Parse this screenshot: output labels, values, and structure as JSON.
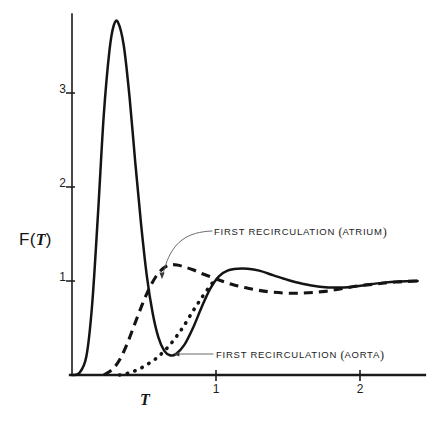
{
  "figure": {
    "axis_labels": {
      "y": "F(T)",
      "y_function": "F",
      "y_variable": "T",
      "x": "T"
    },
    "y_ticks": [
      "1",
      "2",
      "3"
    ],
    "x_ticks": [
      "1",
      "2"
    ],
    "annotations": [
      {
        "name": "atrium",
        "prefix": "FIRST RECIRCULATION",
        "paren_open": "(",
        "target": "ATRIUM",
        "paren_close": ")",
        "full": "FIRST RECIRCULATION (ATRIUM)"
      },
      {
        "name": "aorta",
        "prefix": "FIRST RECIRCULATION",
        "paren_open": "(",
        "target": "AORTA",
        "paren_close": ")",
        "full": "FIRST RECIRCULATION (AORTA)"
      }
    ],
    "colors": {
      "ink": "#1a1a1a",
      "background": "#ffffff",
      "leader": "#4a4a4a"
    }
  },
  "chart_data": {
    "type": "line",
    "title": "",
    "subtitle": "",
    "xlabel": "T",
    "ylabel": "F(T)",
    "xlim": [
      0,
      2.5
    ],
    "ylim": [
      0,
      3.9
    ],
    "grid": false,
    "legend_position": "inline-annotations",
    "x_tick_values": [
      1,
      2
    ],
    "y_tick_values": [
      1,
      2,
      3
    ],
    "series": [
      {
        "name": "primary-dilution-curve",
        "style": "solid",
        "description": "Main indicator dilution curve with sharp first-pass peak near 3.75 and damped oscillation settling to 1",
        "x": [
          0.0,
          0.05,
          0.1,
          0.14,
          0.18,
          0.22,
          0.26,
          0.29,
          0.32,
          0.36,
          0.4,
          0.44,
          0.48,
          0.52,
          0.56,
          0.6,
          0.64,
          0.68,
          0.72,
          0.78,
          0.84,
          0.9,
          0.96,
          1.02,
          1.08,
          1.15,
          1.22,
          1.3,
          1.4,
          1.5,
          1.6,
          1.72,
          1.84,
          1.95,
          2.05,
          2.15,
          2.28,
          2.4
        ],
        "y": [
          0.0,
          0.02,
          0.2,
          0.75,
          1.7,
          2.75,
          3.45,
          3.72,
          3.75,
          3.5,
          2.95,
          2.25,
          1.6,
          1.05,
          0.66,
          0.4,
          0.26,
          0.21,
          0.22,
          0.32,
          0.5,
          0.72,
          0.92,
          1.05,
          1.11,
          1.13,
          1.13,
          1.11,
          1.06,
          1.01,
          0.97,
          0.94,
          0.93,
          0.94,
          0.96,
          0.98,
          0.995,
          1.0
        ]
      },
      {
        "name": "first-recirculation-atrium",
        "style": "dashed",
        "description": "Dashed curve: first recirculation component measured at the atrium, broad hump peaking near 1.17 at T = 0.70",
        "x": [
          0.22,
          0.28,
          0.33,
          0.38,
          0.43,
          0.48,
          0.53,
          0.58,
          0.63,
          0.68,
          0.73,
          0.78,
          0.84,
          0.9,
          0.97,
          1.04,
          1.12,
          1.2,
          1.3,
          1.4,
          1.52,
          1.64,
          1.76,
          1.88,
          2.0,
          2.12,
          2.25,
          2.4
        ],
        "y": [
          0.0,
          0.06,
          0.16,
          0.32,
          0.52,
          0.72,
          0.9,
          1.04,
          1.13,
          1.17,
          1.17,
          1.15,
          1.12,
          1.08,
          1.04,
          1.0,
          0.96,
          0.93,
          0.9,
          0.88,
          0.87,
          0.875,
          0.89,
          0.92,
          0.95,
          0.97,
          0.99,
          1.0
        ]
      },
      {
        "name": "first-recirculation-aorta",
        "style": "dotted",
        "description": "Dotted curve: first recirculation component measured at the aorta, rising from baseline near T = 0.33 and merging with the primary curve",
        "x": [
          0.33,
          0.38,
          0.43,
          0.48,
          0.53,
          0.58,
          0.63,
          0.68,
          0.73,
          0.78,
          0.84,
          0.9,
          0.96,
          1.0
        ],
        "y": [
          0.0,
          0.015,
          0.04,
          0.075,
          0.12,
          0.17,
          0.24,
          0.32,
          0.42,
          0.53,
          0.68,
          0.82,
          0.95,
          1.02
        ]
      }
    ],
    "annotations": [
      {
        "text": "FIRST RECIRCULATION (ATRIUM)",
        "points_to_series": "first-recirculation-atrium",
        "point_x": 0.55,
        "point_y": 1.0,
        "label_x": 0.85,
        "label_y": 1.55
      },
      {
        "text": "FIRST RECIRCULATION (AORTA)",
        "points_to_series": "first-recirculation-aorta",
        "point_x": 0.62,
        "point_y": 0.225,
        "label_x": 0.98,
        "label_y": 0.225
      }
    ]
  }
}
